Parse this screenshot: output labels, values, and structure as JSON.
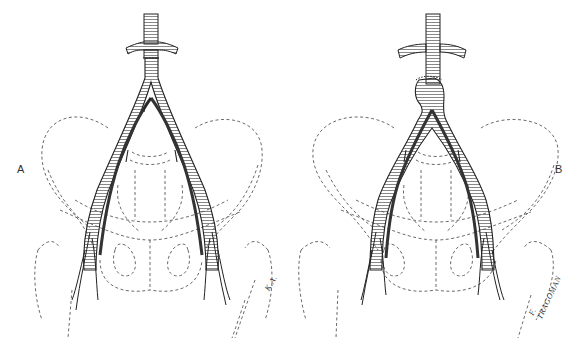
{
  "figure": {
    "panels": [
      {
        "label": "A",
        "anastomosis": "end-to-end proximal aortic anastomosis"
      },
      {
        "label": "B",
        "anastomosis": "end-to-side proximal aortic anastomosis"
      }
    ],
    "signatures": [
      "K.A.",
      "F. TRAGOMAN"
    ],
    "colors": {
      "line": "#222222",
      "dash": "#444444",
      "background": "#ffffff"
    }
  }
}
